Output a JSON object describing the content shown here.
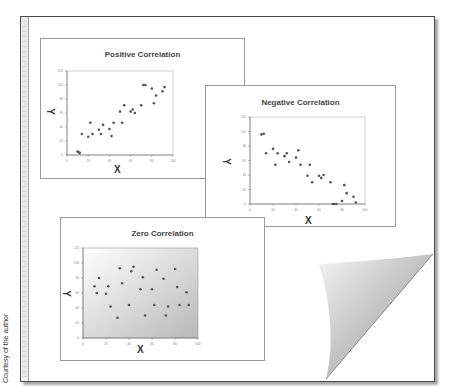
{
  "credit": "Courtesy of the author",
  "colors": {
    "frame": "#4a4a4a",
    "marker": "#555555",
    "title": "#444444",
    "gradient_light": "#ffffff",
    "gradient_dark": "#b8b8b8"
  },
  "chart_data": [
    {
      "type": "scatter",
      "title": "Positive Correlation",
      "xlabel": "X",
      "ylabel": "Y",
      "xlim": [
        0,
        100
      ],
      "ylim": [
        0,
        120
      ],
      "xticks": [
        0,
        20,
        40,
        60,
        80,
        100
      ],
      "yticks": [
        0,
        20,
        40,
        60,
        80,
        100,
        120
      ],
      "grid": false,
      "legend": null,
      "background": "plain",
      "x": [
        10,
        11,
        12,
        14,
        20,
        22,
        24,
        30,
        32,
        34,
        40,
        42,
        44,
        50,
        52,
        54,
        60,
        62,
        64,
        70,
        72,
        74,
        80,
        82,
        84,
        90,
        92
      ],
      "y": [
        5,
        4,
        3,
        30,
        26,
        46,
        30,
        36,
        30,
        43,
        37,
        27,
        46,
        62,
        46,
        71,
        62,
        65,
        60,
        71,
        100,
        100,
        95,
        74,
        85,
        91,
        97
      ]
    },
    {
      "type": "scatter",
      "title": "Negative Correlation",
      "xlabel": "X",
      "ylabel": "Y",
      "xlim": [
        0,
        100
      ],
      "ylim": [
        0,
        120
      ],
      "xticks": [
        0,
        20,
        40,
        60,
        80,
        100
      ],
      "yticks": [
        0,
        20,
        40,
        60,
        80,
        100,
        120
      ],
      "grid": false,
      "legend": null,
      "background": "plain",
      "x": [
        10,
        12,
        14,
        20,
        22,
        24,
        30,
        32,
        34,
        40,
        42,
        44,
        50,
        52,
        54,
        60,
        62,
        64,
        70,
        72,
        73,
        75,
        80,
        82,
        84,
        90,
        92
      ],
      "y": [
        96,
        97,
        70,
        76,
        54,
        70,
        66,
        70,
        58,
        64,
        74,
        54,
        39,
        54,
        30,
        39,
        36,
        40,
        30,
        0,
        0,
        0,
        4,
        26,
        15,
        10,
        2
      ]
    },
    {
      "type": "scatter",
      "title": "Zero Correlation",
      "xlabel": "X",
      "ylabel": "Y",
      "xlim": [
        0,
        100
      ],
      "ylim": [
        0,
        120
      ],
      "xticks": [
        0,
        20,
        40,
        60,
        80,
        100
      ],
      "yticks": [
        0,
        20,
        40,
        60,
        80,
        100,
        120
      ],
      "grid": false,
      "legend": null,
      "background": "gradient",
      "x": [
        10,
        12,
        14,
        20,
        22,
        24,
        30,
        32,
        34,
        40,
        42,
        44,
        50,
        52,
        54,
        60,
        62,
        64,
        70,
        72,
        74,
        80,
        82,
        84,
        90,
        92
      ],
      "y": [
        69,
        60,
        80,
        59,
        69,
        42,
        27,
        93,
        73,
        44,
        89,
        95,
        65,
        81,
        30,
        65,
        44,
        91,
        79,
        30,
        42,
        92,
        68,
        44,
        61,
        44
      ]
    }
  ]
}
